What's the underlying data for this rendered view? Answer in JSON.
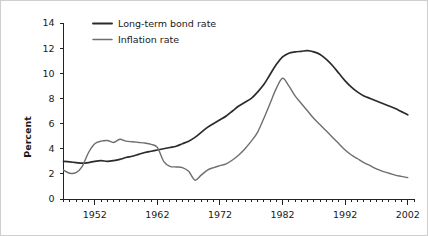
{
  "chart_data": {
    "type": "line",
    "title": "",
    "xlabel": "",
    "ylabel": "Percent",
    "xlim": [
      1947,
      2003
    ],
    "ylim": [
      0,
      14
    ],
    "yticks": [
      0,
      2,
      4,
      6,
      8,
      10,
      12,
      14
    ],
    "ytick_labels": [
      "0",
      "2",
      "4",
      "6",
      "8",
      "10",
      "12",
      "14"
    ],
    "xticks": [
      1952,
      1962,
      1972,
      1982,
      1992,
      2002
    ],
    "xtick_labels": [
      "1952",
      "1962",
      "1972",
      "1982",
      "1992",
      "2002"
    ],
    "minor_xtick_interval": 1,
    "grid": false,
    "legend_position": "top-left",
    "series": [
      {
        "name": "Long-term bond rate",
        "color": "#2b2b2b",
        "linewidth": 1.7,
        "x": [
          1947,
          1948,
          1949,
          1950,
          1951,
          1952,
          1953,
          1954,
          1955,
          1956,
          1957,
          1958,
          1959,
          1960,
          1961,
          1962,
          1963,
          1964,
          1965,
          1966,
          1967,
          1968,
          1969,
          1970,
          1971,
          1972,
          1973,
          1974,
          1975,
          1976,
          1977,
          1978,
          1979,
          1980,
          1981,
          1982,
          1983,
          1984,
          1985,
          1986,
          1987,
          1988,
          1989,
          1990,
          1991,
          1992,
          1993,
          1994,
          1995,
          1996,
          1997,
          1998,
          1999,
          2000,
          2001,
          2002
        ],
        "y": [
          3.0,
          2.95,
          2.9,
          2.85,
          2.9,
          3.0,
          3.05,
          3.0,
          3.05,
          3.15,
          3.3,
          3.4,
          3.55,
          3.7,
          3.8,
          3.9,
          4.0,
          4.1,
          4.2,
          4.4,
          4.6,
          4.9,
          5.3,
          5.7,
          6.0,
          6.3,
          6.6,
          7.0,
          7.4,
          7.7,
          8.0,
          8.5,
          9.1,
          9.9,
          10.7,
          11.3,
          11.6,
          11.7,
          11.75,
          11.8,
          11.7,
          11.5,
          11.1,
          10.6,
          10.0,
          9.4,
          8.9,
          8.5,
          8.2,
          8.0,
          7.8,
          7.6,
          7.4,
          7.2,
          6.95,
          6.7
        ]
      },
      {
        "name": "Inflation rate",
        "color": "#6e6e6e",
        "linewidth": 1.4,
        "x": [
          1947,
          1948,
          1949,
          1950,
          1951,
          1952,
          1953,
          1954,
          1955,
          1956,
          1957,
          1958,
          1959,
          1960,
          1961,
          1962,
          1963,
          1964,
          1965,
          1966,
          1967,
          1968,
          1969,
          1970,
          1971,
          1972,
          1973,
          1974,
          1975,
          1976,
          1977,
          1978,
          1979,
          1980,
          1981,
          1982,
          1983,
          1984,
          1985,
          1986,
          1987,
          1988,
          1989,
          1990,
          1991,
          1992,
          1993,
          1994,
          1995,
          1996,
          1997,
          1998,
          1999,
          2000,
          2001,
          2002
        ],
        "y": [
          2.3,
          2.05,
          2.1,
          2.6,
          3.7,
          4.4,
          4.6,
          4.65,
          4.5,
          4.75,
          4.6,
          4.55,
          4.5,
          4.45,
          4.35,
          4.1,
          3.0,
          2.6,
          2.55,
          2.5,
          2.2,
          1.5,
          1.9,
          2.3,
          2.5,
          2.65,
          2.8,
          3.1,
          3.5,
          4.0,
          4.6,
          5.3,
          6.4,
          7.6,
          8.8,
          9.6,
          9.0,
          8.2,
          7.6,
          7.0,
          6.4,
          5.9,
          5.4,
          4.9,
          4.4,
          3.9,
          3.5,
          3.2,
          2.9,
          2.65,
          2.4,
          2.2,
          2.05,
          1.9,
          1.8,
          1.7
        ]
      }
    ]
  },
  "legend": {
    "entries": [
      {
        "label": "Long-term bond rate"
      },
      {
        "label": "Inflation rate"
      }
    ]
  },
  "axes": {
    "y_axis_title": "Percent"
  }
}
